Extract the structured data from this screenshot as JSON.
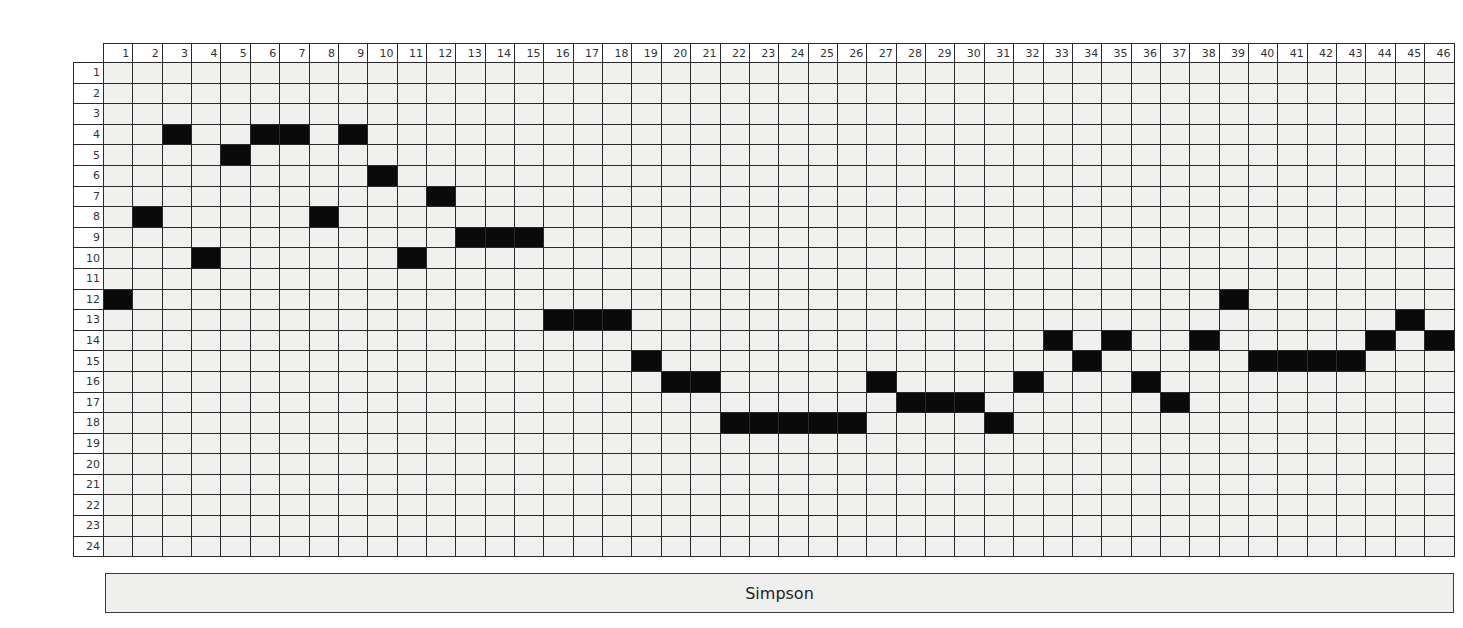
{
  "puzzle": {
    "columns": 46,
    "rows": 24,
    "column_labels": [
      "1",
      "2",
      "3",
      "4",
      "5",
      "6",
      "7",
      "8",
      "9",
      "10",
      "11",
      "12",
      "13",
      "14",
      "15",
      "16",
      "17",
      "18",
      "19",
      "20",
      "21",
      "22",
      "23",
      "24",
      "25",
      "26",
      "27",
      "28",
      "29",
      "30",
      "31",
      "32",
      "33",
      "34",
      "35",
      "36",
      "37",
      "38",
      "39",
      "40",
      "41",
      "42",
      "43",
      "44",
      "45",
      "46"
    ],
    "row_labels": [
      "1",
      "2",
      "3",
      "4",
      "5",
      "6",
      "7",
      "8",
      "9",
      "10",
      "11",
      "12",
      "13",
      "14",
      "15",
      "16",
      "17",
      "18",
      "19",
      "20",
      "21",
      "22",
      "23",
      "24"
    ],
    "filled_cells": {
      "4": [
        3,
        6,
        7,
        9
      ],
      "5": [
        5
      ],
      "6": [
        10
      ],
      "7": [
        12
      ],
      "8": [
        2,
        8
      ],
      "9": [
        13,
        14,
        15
      ],
      "10": [
        4,
        11
      ],
      "12": [
        1,
        39
      ],
      "13": [
        16,
        17,
        18,
        45
      ],
      "14": [
        33,
        35,
        38,
        44,
        46
      ],
      "15": [
        19,
        34,
        40,
        41,
        42,
        43
      ],
      "16": [
        20,
        21,
        27,
        32,
        36
      ],
      "17": [
        28,
        29,
        30,
        37
      ],
      "18": [
        22,
        23,
        24,
        25,
        26,
        31
      ]
    },
    "colors": {
      "filled": "#0a0a0a",
      "empty": "#f0f0ef",
      "grid_line": "#2a2a2a"
    }
  },
  "answer_label": "Simpson"
}
